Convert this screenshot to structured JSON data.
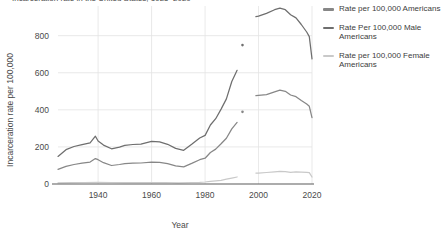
{
  "figure": {
    "clipped_header": "Incarceration rate in the United States, 1925–2020"
  },
  "legend": {
    "position": "right",
    "items": [
      {
        "label": "Rate per 100,000 Americans",
        "color": "#878787",
        "name": "legend-item-total"
      },
      {
        "label": "Rate Per 100,000 Male Americans",
        "color": "#6e6e6e",
        "name": "legend-item-male"
      },
      {
        "label": "Rate per 100,000 Female Americans",
        "color": "#c9c9c9",
        "name": "legend-item-female"
      }
    ]
  },
  "chart_data": {
    "type": "line",
    "title": "",
    "xlabel": "Year",
    "ylabel": "Incarceration rate per 100,000",
    "xlim": [
      1925,
      2020
    ],
    "ylim": [
      0,
      960
    ],
    "xticks": [
      1940,
      1960,
      1980,
      2000,
      2020
    ],
    "xticklabels": [
      "1940",
      "1960",
      "1980",
      "2000",
      "2020"
    ],
    "yticks": [
      0,
      200,
      400,
      600,
      800
    ],
    "yticklabels": [
      "0",
      "200",
      "400",
      "600",
      "800"
    ],
    "grid": true,
    "grid_color": "#e3e3e3",
    "background": "#ffffff",
    "data_gap": {
      "start": 1993,
      "end": 1999,
      "note": "series interrupted; dotted/dashed fragments and isolated points shown"
    },
    "series": [
      {
        "name": "Rate per 100,000 Americans",
        "color": "#878787",
        "x": [
          1925,
          1928,
          1931,
          1934,
          1937,
          1939,
          1940,
          1942,
          1945,
          1948,
          1950,
          1953,
          1956,
          1960,
          1963,
          1966,
          1969,
          1972,
          1975,
          1978,
          1980,
          1982,
          1984,
          1986,
          1988,
          1990,
          1992,
          1994,
          1999,
          2000,
          2003,
          2006,
          2008,
          2010,
          2012,
          2014,
          2016,
          2018,
          2019,
          2020
        ],
        "y": [
          79,
          95,
          105,
          112,
          118,
          137,
          131,
          115,
          100,
          105,
          110,
          112,
          113,
          118,
          117,
          110,
          98,
          93,
          111,
          131,
          139,
          170,
          188,
          217,
          247,
          297,
          332,
          389,
          476,
          478,
          482,
          497,
          506,
          500,
          480,
          471,
          450,
          431,
          419,
          358
        ]
      },
      {
        "name": "Rate Per 100,000 Male Americans",
        "color": "#6e6e6e",
        "x": [
          1925,
          1928,
          1931,
          1934,
          1937,
          1939,
          1940,
          1942,
          1945,
          1948,
          1950,
          1953,
          1956,
          1960,
          1963,
          1966,
          1969,
          1972,
          1975,
          1978,
          1980,
          1982,
          1984,
          1986,
          1988,
          1990,
          1992,
          1994,
          1999,
          2000,
          2003,
          2006,
          2008,
          2010,
          2012,
          2014,
          2016,
          2018,
          2019,
          2020
        ],
        "y": [
          149,
          185,
          202,
          212,
          222,
          258,
          232,
          210,
          190,
          199,
          208,
          213,
          215,
          230,
          227,
          214,
          192,
          182,
          214,
          248,
          262,
          318,
          352,
          404,
          459,
          553,
          613,
          749,
          903,
          905,
          920,
          940,
          948,
          940,
          913,
          896,
          860,
          820,
          795,
          675
        ]
      },
      {
        "name": "Rate per 100,000 Female Americans",
        "color": "#c9c9c9",
        "x": [
          1925,
          1930,
          1935,
          1940,
          1945,
          1950,
          1955,
          1960,
          1965,
          1970,
          1975,
          1978,
          1980,
          1982,
          1984,
          1986,
          1988,
          1990,
          1992,
          1994,
          1999,
          2000,
          2003,
          2006,
          2008,
          2010,
          2012,
          2014,
          2016,
          2018,
          2019,
          2020
        ],
        "y": [
          6,
          7,
          8,
          9,
          8,
          8,
          8,
          8,
          8,
          6,
          8,
          9,
          11,
          14,
          17,
          20,
          26,
          32,
          38,
          47,
          59,
          59,
          62,
          65,
          68,
          67,
          63,
          65,
          64,
          63,
          61,
          38
        ]
      }
    ],
    "annotations": [
      {
        "type": "point",
        "series": "Rate Per 100,000 Male Americans",
        "x": 1994,
        "y": 749
      },
      {
        "type": "point",
        "series": "Rate per 100,000 Americans",
        "x": 1994,
        "y": 389
      }
    ]
  }
}
